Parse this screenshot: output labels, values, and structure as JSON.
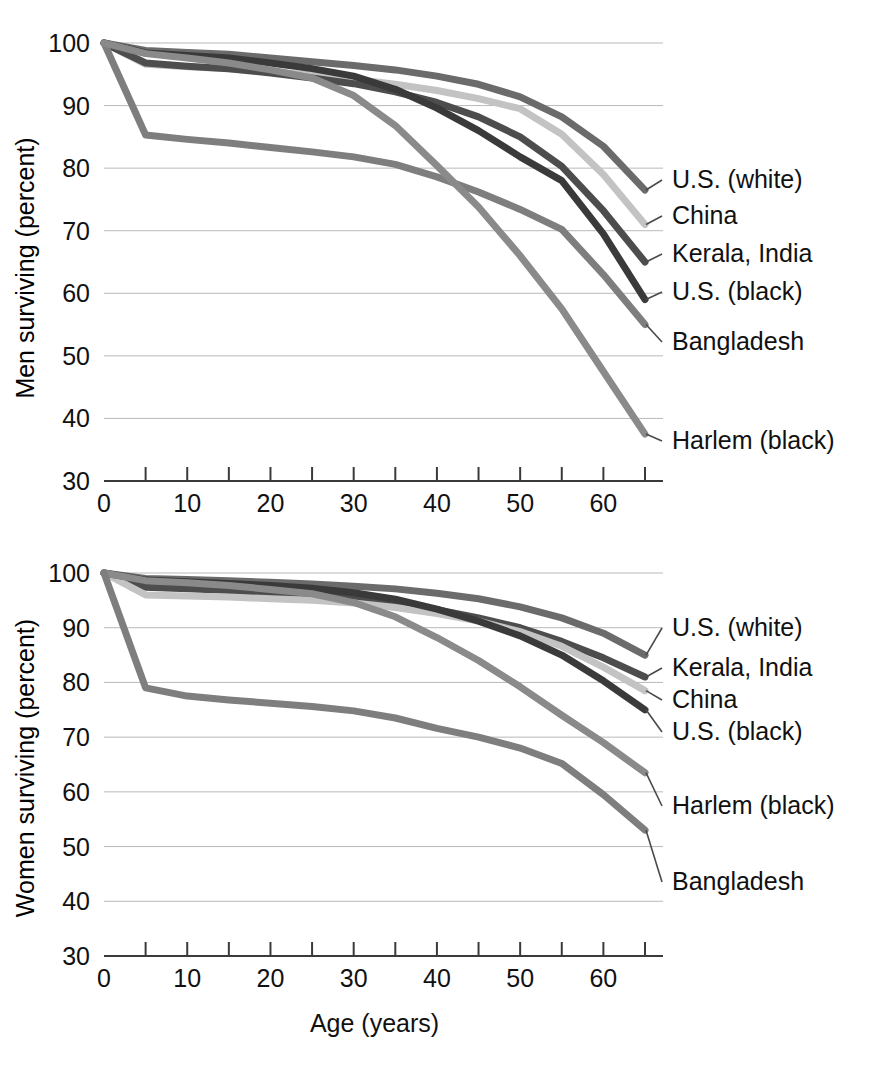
{
  "figure": {
    "background": "#ffffff",
    "width": 873,
    "height": 1082
  },
  "chart_data": [
    {
      "type": "line",
      "panel_id": "men",
      "title": "",
      "xlabel": "",
      "ylabel": "Men surviving (percent)",
      "xlim": [
        0,
        65
      ],
      "ylim": [
        30,
        100
      ],
      "xticks": [
        0,
        5,
        10,
        15,
        20,
        25,
        30,
        35,
        40,
        45,
        50,
        55,
        60,
        65
      ],
      "xticklabels": [
        "0",
        "",
        "10",
        "",
        "20",
        "",
        "30",
        "",
        "40",
        "",
        "50",
        "",
        "60",
        ""
      ],
      "yticks": [
        30,
        40,
        50,
        60,
        70,
        80,
        90,
        100
      ],
      "yticklabels": [
        "30",
        "40",
        "50",
        "60",
        "70",
        "80",
        "90",
        "100"
      ],
      "grid": "horizontal",
      "legend_position": "right-inline-labels",
      "x": [
        0,
        5,
        10,
        15,
        20,
        25,
        30,
        35,
        40,
        45,
        50,
        55,
        60,
        65
      ],
      "series": [
        {
          "name": "U.S. (white)",
          "color": "#6b6b6b",
          "label_value": 76.5,
          "values": [
            100,
            98.8,
            98.5,
            98.2,
            97.6,
            97.0,
            96.4,
            95.7,
            94.7,
            93.4,
            91.4,
            88.2,
            83.5,
            76.5
          ]
        },
        {
          "name": "China",
          "color": "#c3c3c3",
          "label_value": 71.0,
          "values": [
            100,
            96.6,
            96.2,
            95.9,
            95.4,
            94.9,
            94.2,
            93.4,
            92.4,
            91.1,
            89.5,
            85.4,
            79.0,
            71.0
          ]
        },
        {
          "name": "Kerala, India",
          "color": "#4d4d4d",
          "label_value": 65.0,
          "values": [
            100,
            96.8,
            96.3,
            95.9,
            95.2,
            94.4,
            93.5,
            92.2,
            90.5,
            88.2,
            85.0,
            80.3,
            73.2,
            65.0
          ]
        },
        {
          "name": "U.S. (black)",
          "color": "#3a3a3a",
          "label_value": 59.0,
          "values": [
            100,
            98.4,
            98.0,
            97.6,
            96.8,
            95.9,
            94.7,
            92.6,
            89.6,
            86.0,
            81.8,
            78.0,
            69.5,
            59.0
          ]
        },
        {
          "name": "Bangladesh",
          "color": "#7e7e7e",
          "label_value": 55.0,
          "values": [
            100,
            85.3,
            84.6,
            84.0,
            83.3,
            82.6,
            81.8,
            80.6,
            78.6,
            76.2,
            73.4,
            70.2,
            63.0,
            55.0
          ]
        },
        {
          "name": "Harlem (black)",
          "color": "#8a8a8a",
          "label_value": 37.5,
          "values": [
            100,
            98.3,
            97.6,
            96.8,
            95.7,
            94.4,
            91.6,
            86.8,
            80.4,
            73.8,
            66.0,
            57.5,
            47.5,
            37.5
          ]
        }
      ]
    },
    {
      "type": "line",
      "panel_id": "women",
      "title": "",
      "xlabel": "Age (years)",
      "ylabel": "Women surviving (percent)",
      "xlim": [
        0,
        65
      ],
      "ylim": [
        30,
        100
      ],
      "xticks": [
        0,
        5,
        10,
        15,
        20,
        25,
        30,
        35,
        40,
        45,
        50,
        55,
        60,
        65
      ],
      "xticklabels": [
        "0",
        "",
        "10",
        "",
        "20",
        "",
        "30",
        "",
        "40",
        "",
        "50",
        "",
        "60",
        ""
      ],
      "yticks": [
        30,
        40,
        50,
        60,
        70,
        80,
        90,
        100
      ],
      "yticklabels": [
        "30",
        "40",
        "50",
        "60",
        "70",
        "80",
        "90",
        "100"
      ],
      "grid": "horizontal",
      "legend_position": "right-inline-labels",
      "x": [
        0,
        5,
        10,
        15,
        20,
        25,
        30,
        35,
        40,
        45,
        50,
        55,
        60,
        65
      ],
      "series": [
        {
          "name": "U.S. (white)",
          "color": "#6b6b6b",
          "label_value": 85.0,
          "values": [
            100,
            99.0,
            98.8,
            98.6,
            98.3,
            98.0,
            97.6,
            97.1,
            96.3,
            95.3,
            93.8,
            91.8,
            89.0,
            85.0
          ]
        },
        {
          "name": "Kerala, India",
          "color": "#4d4d4d",
          "label_value": 81.0,
          "values": [
            100,
            97.4,
            97.1,
            96.8,
            96.4,
            96.0,
            95.4,
            94.5,
            93.3,
            91.8,
            90.0,
            87.5,
            84.5,
            81.0
          ]
        },
        {
          "name": "China",
          "color": "#c3c3c3",
          "label_value": 78.5,
          "values": [
            100,
            96.0,
            95.8,
            95.6,
            95.3,
            95.0,
            94.5,
            93.7,
            92.6,
            91.2,
            89.3,
            86.6,
            82.8,
            78.5
          ]
        },
        {
          "name": "U.S. (black)",
          "color": "#3a3a3a",
          "label_value": 75.0,
          "values": [
            100,
            98.7,
            98.4,
            98.1,
            97.7,
            97.2,
            96.4,
            95.2,
            93.4,
            91.2,
            88.5,
            85.0,
            80.3,
            75.0
          ]
        },
        {
          "name": "Harlem (black)",
          "color": "#8a8a8a",
          "label_value": 63.5,
          "values": [
            100,
            98.6,
            98.2,
            97.7,
            97.0,
            96.2,
            94.6,
            92.0,
            88.2,
            84.0,
            79.2,
            74.0,
            69.0,
            63.5
          ]
        },
        {
          "name": "Bangladesh",
          "color": "#7e7e7e",
          "label_value": 53.0,
          "values": [
            100,
            79.0,
            77.5,
            76.8,
            76.2,
            75.6,
            74.8,
            73.5,
            71.6,
            70.0,
            68.0,
            65.2,
            59.5,
            53.0
          ]
        }
      ]
    }
  ]
}
